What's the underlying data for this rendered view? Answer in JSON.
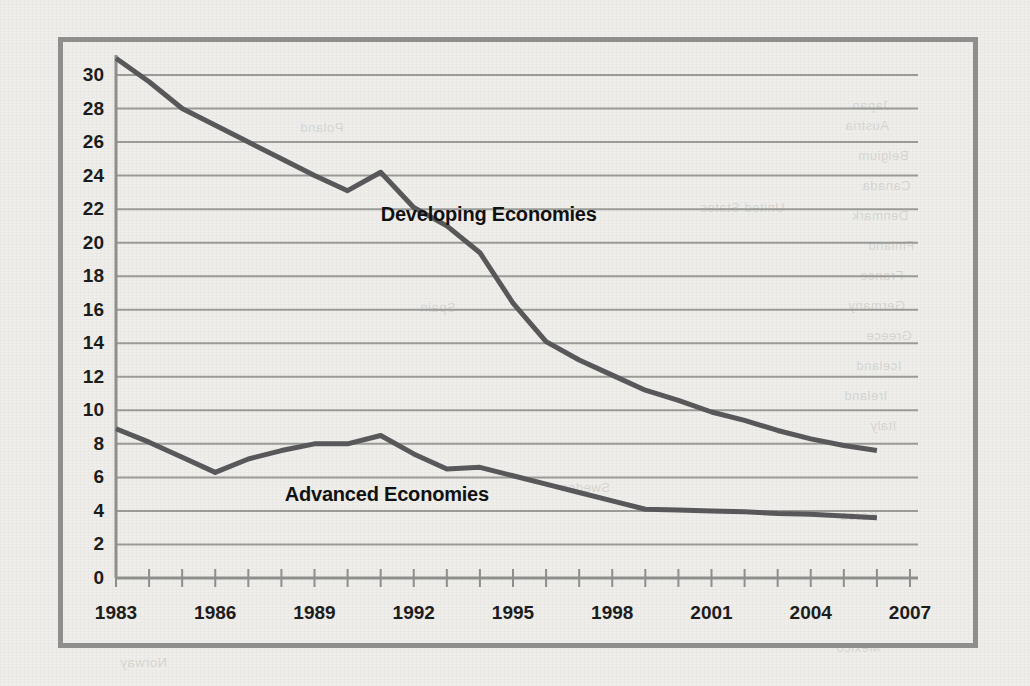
{
  "chart_data": {
    "type": "line",
    "title": "",
    "subtitle": "",
    "xlabel": "",
    "ylabel": "",
    "xlim": [
      1983,
      2007
    ],
    "ylim": [
      0,
      31
    ],
    "grid": true,
    "legend_position": "inline-annotation",
    "y_ticks": [
      0,
      2,
      4,
      6,
      8,
      10,
      12,
      14,
      16,
      18,
      20,
      22,
      24,
      26,
      28,
      30
    ],
    "y_tick_labels": [
      "0",
      "2",
      "4",
      "6",
      "8",
      "10",
      "12",
      "14",
      "16",
      "18",
      "20",
      "22",
      "24",
      "26",
      "28",
      "30"
    ],
    "x_ticks": [
      1983,
      1984,
      1985,
      1986,
      1987,
      1988,
      1989,
      1990,
      1991,
      1992,
      1993,
      1994,
      1995,
      1996,
      1997,
      1998,
      1999,
      2000,
      2001,
      2002,
      2003,
      2004,
      2005,
      2006,
      2007
    ],
    "x_tick_labels": [
      "1983",
      "1986",
      "1989",
      "1992",
      "1995",
      "1998",
      "2001",
      "2004",
      "2007"
    ],
    "x_labeled_ticks": [
      1983,
      1986,
      1989,
      1992,
      1995,
      1998,
      2001,
      2004,
      2007
    ],
    "x": [
      1983,
      1984,
      1985,
      1986,
      1987,
      1988,
      1989,
      1990,
      1991,
      1992,
      1993,
      1994,
      1995,
      1996,
      1997,
      1998,
      1999,
      2000,
      2001,
      2002,
      2003,
      2004,
      2005,
      2006
    ],
    "series": [
      {
        "name": "Developing Economies",
        "color": "#58585a",
        "values": [
          31.0,
          29.6,
          28.0,
          27.0,
          26.0,
          25.0,
          24.0,
          23.1,
          24.2,
          22.1,
          21.0,
          19.4,
          16.4,
          14.1,
          13.0,
          12.1,
          11.2,
          10.6,
          9.9,
          9.4,
          8.8,
          8.3,
          7.9,
          7.6
        ],
        "label_x": 1991.0,
        "label_y": 21.6
      },
      {
        "name": "Advanced Economies",
        "color": "#58585a",
        "values": [
          8.9,
          8.1,
          7.2,
          6.3,
          7.1,
          7.6,
          8.0,
          8.0,
          8.5,
          7.4,
          6.5,
          6.6,
          6.1,
          5.6,
          5.1,
          4.6,
          4.1,
          4.05,
          4.0,
          3.95,
          3.85,
          3.8,
          3.7,
          3.6
        ],
        "label_x": 1988.1,
        "label_y": 4.9
      }
    ]
  },
  "styling": {
    "background_color": "#efeeea",
    "frame_color": "#8e8e8c",
    "gridline_color": "#9a9a96",
    "axis_color": "#8e8e8c",
    "line_color": "#58585a",
    "tick_label_color": "#1c1c1c"
  },
  "bleed_through_text": [
    "Austria",
    "Belgium",
    "Canada",
    "Denmark",
    "Finland",
    "France",
    "Germany",
    "Greece",
    "Iceland",
    "Ireland",
    "Italy",
    "Japan",
    "Korea",
    "Mexico",
    "Norway",
    "Poland",
    "Spain",
    "Sweden",
    "United States"
  ]
}
